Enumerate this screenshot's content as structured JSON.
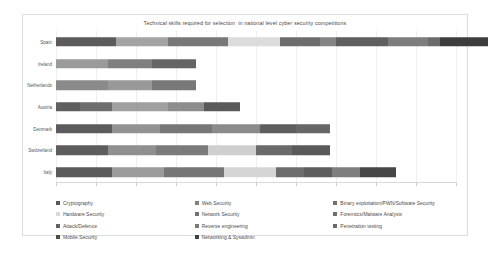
{
  "chart_data": {
    "type": "bar",
    "orientation": "horizontal",
    "stacked": true,
    "title": "Technical skills required for selection  in national level cyber security competitions",
    "xlabel": "",
    "ylabel": "",
    "grid": true,
    "legend_position": "bottom",
    "xlim": [
      0,
      10
    ],
    "xticks": [
      0,
      1,
      2,
      3,
      4,
      5,
      6,
      7,
      8,
      9,
      10
    ],
    "xtick_labels": [
      "",
      "",
      "",
      "",
      "",
      "",
      "",
      "",
      "",
      "",
      ""
    ],
    "categories": [
      "Spain",
      "Ireland",
      "Netherlands",
      "Austria",
      "Denmark",
      "Switzerland",
      "Italy"
    ],
    "series": [
      {
        "name": "Cryptography",
        "color": "#595959",
        "values": [
          1,
          1,
          1,
          1,
          1,
          1,
          1
        ]
      },
      {
        "name": "Hardware Security",
        "color": "#a6a6a6",
        "values": [
          1,
          1,
          1,
          0,
          1,
          1,
          1
        ]
      },
      {
        "name": "Web Security",
        "color": "#808080",
        "values": [
          1,
          1,
          1,
          1,
          1,
          1,
          1
        ]
      },
      {
        "name": "Network Security",
        "color": "#737373",
        "values": [
          1,
          0,
          0,
          1,
          1,
          0,
          0
        ]
      },
      {
        "name": "Binary exploitation/PWN/Software Security",
        "color": "#d9d9d9",
        "values": [
          1,
          0,
          0,
          0,
          1,
          1,
          1
        ]
      },
      {
        "name": "Forensics/Malware Analysis",
        "color": "#6e6e6e",
        "values": [
          1,
          0,
          0,
          1,
          1,
          1,
          1
        ]
      },
      {
        "name": "Attack/Defence",
        "color": "#636363",
        "values": [
          1,
          0,
          0,
          0,
          1,
          0,
          1
        ]
      },
      {
        "name": "Reverse engineering",
        "color": "#7a7a7a",
        "values": [
          1,
          0,
          0,
          0,
          1,
          1,
          1
        ]
      },
      {
        "name": "Penetration testing",
        "color": "#6a6a6a",
        "values": [
          1,
          0,
          0,
          0,
          0,
          0,
          0
        ]
      },
      {
        "name": "Mobile Security",
        "color": "#4d4d4d",
        "values": [
          1,
          0,
          0,
          0,
          0,
          0,
          0
        ]
      },
      {
        "name": "Networking & Sysadmin",
        "color": "#3f3f3f",
        "values": [
          1,
          0,
          0,
          0,
          0,
          0,
          0
        ]
      }
    ],
    "bar_totals": [
      10,
      3.5,
      3.5,
      4.6,
      6.85,
      6.85,
      8.0
    ],
    "bars": [
      {
        "category": "Spain",
        "segments": [
          {
            "label": "Cryptography",
            "color": "#5b5b5b",
            "span": 1.5
          },
          {
            "label": "Hardware Security",
            "color": "#a3a3a3",
            "span": 1.3
          },
          {
            "label": "Web Security",
            "color": "#787878",
            "span": 1.5
          },
          {
            "label": "Binary exploitation/PWN/Software Security",
            "color": "#dcdcdc",
            "span": 1.3
          },
          {
            "label": "Network Security",
            "color": "#6d6d6d",
            "span": 1.0
          },
          {
            "label": "Forensics/Malware Analysis",
            "color": "#848484",
            "span": 0.4
          },
          {
            "label": "Attack/Defence",
            "color": "#5f5f5f",
            "span": 1.3
          },
          {
            "label": "Reverse engineering",
            "color": "#7d7d7d",
            "span": 1.0
          },
          {
            "label": "Penetration testing",
            "color": "#6b6b6b",
            "span": 0.3
          },
          {
            "label": "Mobile Security",
            "color": "#3d3d3d",
            "span": 1.2
          }
        ]
      },
      {
        "category": "Ireland",
        "segments": [
          {
            "label": "Cryptography",
            "color": "#9a9a9a",
            "span": 1.3
          },
          {
            "label": "Hardware Security",
            "color": "#7f7f7f",
            "span": 1.1
          },
          {
            "label": "Web Security",
            "color": "#656565",
            "span": 1.1
          }
        ]
      },
      {
        "category": "Netherlands",
        "segments": [
          {
            "label": "Cryptography",
            "color": "#8a8a8a",
            "span": 1.3
          },
          {
            "label": "Hardware Security",
            "color": "#999999",
            "span": 1.1
          },
          {
            "label": "Web Security",
            "color": "#787878",
            "span": 1.1
          }
        ]
      },
      {
        "category": "Austria",
        "segments": [
          {
            "label": "Cryptography",
            "color": "#5f5f5f",
            "span": 0.6
          },
          {
            "label": "Hardware Security",
            "color": "#6e6e6e",
            "span": 0.8
          },
          {
            "label": "Web Security",
            "color": "#a0a0a0",
            "span": 1.4
          },
          {
            "label": "Network Security",
            "color": "#8d8d8d",
            "span": 0.9
          },
          {
            "label": "Forensics/Malware Analysis",
            "color": "#5a5a5a",
            "span": 0.9
          }
        ]
      },
      {
        "category": "Denmark",
        "segments": [
          {
            "label": "Cryptography",
            "color": "#5c5c5c",
            "span": 1.4
          },
          {
            "label": "Hardware Security",
            "color": "#929292",
            "span": 1.2
          },
          {
            "label": "Web Security",
            "color": "#777777",
            "span": 1.3
          },
          {
            "label": "Network Security",
            "color": "#8b8b8b",
            "span": 1.2
          },
          {
            "label": "Forensics/Malware Analysis",
            "color": "#5e5e5e",
            "span": 0.9
          },
          {
            "label": "Attack/Defence",
            "color": "#666666",
            "span": 0.85
          }
        ]
      },
      {
        "category": "Switzerland",
        "segments": [
          {
            "label": "Cryptography",
            "color": "#5d5d5d",
            "span": 1.3
          },
          {
            "label": "Hardware Security",
            "color": "#8f8f8f",
            "span": 1.2
          },
          {
            "label": "Web Security",
            "color": "#7b7b7b",
            "span": 1.3
          },
          {
            "label": "Binary exploitation/PWN/Software Security",
            "color": "#cfcfcf",
            "span": 1.2
          },
          {
            "label": "Forensics/Malware Analysis",
            "color": "#6a6a6a",
            "span": 0.9
          },
          {
            "label": "Reverse engineering",
            "color": "#5a5a5a",
            "span": 0.95
          }
        ]
      },
      {
        "category": "Italy",
        "segments": [
          {
            "label": "Cryptography",
            "color": "#5a5a5a",
            "span": 1.4
          },
          {
            "label": "Hardware Security",
            "color": "#9b9b9b",
            "span": 1.3
          },
          {
            "label": "Web Security",
            "color": "#767676",
            "span": 1.5
          },
          {
            "label": "Binary exploitation/PWN/Software Security",
            "color": "#d5d5d5",
            "span": 1.3
          },
          {
            "label": "Forensics/Malware Analysis",
            "color": "#6d6d6d",
            "span": 0.7
          },
          {
            "label": "Attack/Defence",
            "color": "#5e5e5e",
            "span": 0.7
          },
          {
            "label": "Reverse engineering",
            "color": "#7e7e7e",
            "span": 0.7
          },
          {
            "label": "Penetration testing",
            "color": "#464646",
            "span": 0.9
          }
        ]
      }
    ]
  },
  "legend": {
    "items": [
      {
        "label": "Cryptography",
        "color": "#595959"
      },
      {
        "label": "Hardware Security",
        "color": "#d9d9d9"
      },
      {
        "label": "Attack/Defence",
        "color": "#636363"
      },
      {
        "label": "Mobile Security",
        "color": "#4d4d4d"
      },
      {
        "label": "Web Security",
        "color": "#808080"
      },
      {
        "label": "Network Security",
        "color": "#737373"
      },
      {
        "label": "Reverse engineering",
        "color": "#7a7a7a"
      },
      {
        "label": "Networking & Sysadmin",
        "color": "#3f3f3f"
      },
      {
        "label": "Binary exploitation/PWN/Software Security",
        "color": "#6f6f6f"
      },
      {
        "label": "Forensics/Malware Analysis",
        "color": "#6e6e6e"
      },
      {
        "label": "Penetration testing",
        "color": "#6a6a6a"
      }
    ]
  }
}
